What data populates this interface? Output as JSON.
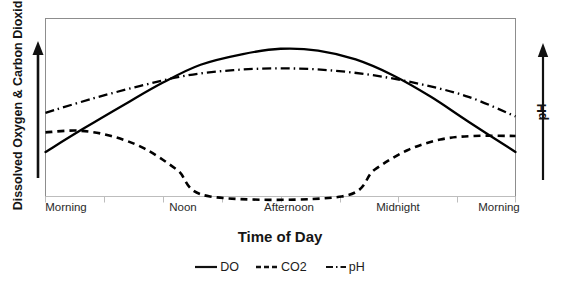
{
  "chart_data": {
    "type": "line",
    "title": "",
    "xlabel": "Time of Day",
    "ylabel": "Dissolved Oxygen & Carbon Dioxide",
    "ylabel_right": "pH",
    "grid": false,
    "legend_position": "bottom",
    "axis_arrows": {
      "left": "upward arrow beside y-axis",
      "right": "upward arrow beside right axis"
    },
    "xticks": [
      "Morning",
      "Noon",
      "Afternoon",
      "Midnight",
      "Morning"
    ],
    "yticks": [],
    "ylim": [
      0,
      1
    ],
    "xlim": [
      0,
      1
    ],
    "series": [
      {
        "name": "DO",
        "style": "solid",
        "color": "#000000",
        "x": [
          0.0,
          0.08,
          0.17,
          0.25,
          0.33,
          0.42,
          0.5,
          0.58,
          0.66,
          0.74,
          0.82,
          0.9,
          1.0
        ],
        "values": [
          0.25,
          0.38,
          0.52,
          0.64,
          0.74,
          0.8,
          0.83,
          0.82,
          0.77,
          0.68,
          0.56,
          0.42,
          0.25
        ]
      },
      {
        "name": "CO2",
        "style": "dashed",
        "color": "#000000",
        "x": [
          0.0,
          0.07,
          0.14,
          0.21,
          0.28,
          0.35,
          0.63,
          0.7,
          0.77,
          0.84,
          0.91,
          1.0
        ],
        "values": [
          0.36,
          0.37,
          0.34,
          0.27,
          0.15,
          0.0,
          0.0,
          0.15,
          0.26,
          0.32,
          0.34,
          0.34
        ]
      },
      {
        "name": "pH",
        "style": "dashdot",
        "color": "#000000",
        "x": [
          0.0,
          0.1,
          0.2,
          0.3,
          0.4,
          0.5,
          0.6,
          0.7,
          0.8,
          0.9,
          1.0
        ],
        "values": [
          0.47,
          0.55,
          0.62,
          0.68,
          0.71,
          0.72,
          0.71,
          0.68,
          0.63,
          0.56,
          0.45
        ]
      }
    ]
  },
  "axes": {
    "y_title": "Dissolved Oxygen & Carbon Dioxide",
    "y2_title": "pH",
    "x_title": "Time of Day"
  },
  "xticks": {
    "t0": "Morning",
    "t1": "Noon",
    "t2": "Afternoon",
    "t3": "Midnight",
    "t4": "Morning"
  },
  "legend": {
    "items": [
      {
        "label": "DO",
        "style": "solid"
      },
      {
        "label": "CO2",
        "style": "dashed"
      },
      {
        "label": "pH",
        "style": "dashdot"
      }
    ]
  }
}
